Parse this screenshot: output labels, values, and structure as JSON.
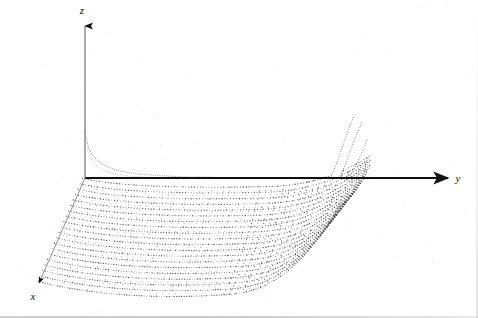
{
  "figure": {
    "kind": "3d-dotted-mesh-surface-plot",
    "background_color": "#ffffff",
    "ink_color": "#1a1a1a",
    "mesh_color": "#3a3a3a",
    "faint_color": "#b8b8b8",
    "axes": {
      "z": {
        "label": "z",
        "direction": "up",
        "origin_px": [
          85,
          178
        ],
        "tip_px": [
          85,
          20
        ],
        "arrow": true
      },
      "y": {
        "label": "y",
        "direction": "right",
        "origin_px": [
          85,
          178
        ],
        "tip_px": [
          452,
          178
        ],
        "arrow": true
      },
      "x": {
        "label": "x",
        "direction": "down-left",
        "origin_px": [
          85,
          178
        ],
        "tip_px": [
          36,
          287
        ],
        "arrow": true
      }
    }
  },
  "chart_data": {
    "type": "line",
    "title": "",
    "xlabel": "x",
    "ylabel": "y",
    "zlabel": "z",
    "projection": "oblique-3d",
    "grid": false,
    "legend": false,
    "xlim": [
      0,
      1
    ],
    "ylim": [
      0,
      1
    ],
    "zlim": [
      -1,
      1
    ],
    "mesh": {
      "profile_curve_count": 20,
      "dotted": true,
      "dot_spacing_px": 3,
      "dot_radius_px": 0.55
    },
    "series": [
      {
        "name": "origin-hyperbola",
        "note": "Steep hyperbolic branch hugging the z-axis at the origin and decaying onto the y-axis.",
        "points": [
          [
            85,
            128
          ],
          [
            86,
            137
          ],
          [
            88,
            145
          ],
          [
            90,
            151
          ],
          [
            93,
            156
          ],
          [
            97,
            160
          ],
          [
            102,
            164
          ],
          [
            108,
            167
          ],
          [
            116,
            170
          ],
          [
            126,
            172
          ],
          [
            138,
            174
          ],
          [
            152,
            175
          ],
          [
            168,
            176
          ],
          [
            186,
            177
          ],
          [
            206,
            177
          ],
          [
            228,
            178
          ]
        ]
      },
      {
        "name": "singular-ridge-1",
        "note": "Innermost steeply rising curve at the far y edge.",
        "points": [
          [
            330,
            178
          ],
          [
            333,
            172
          ],
          [
            336,
            165
          ],
          [
            339,
            157
          ],
          [
            342,
            148
          ],
          [
            345,
            139
          ],
          [
            348,
            131
          ],
          [
            351,
            123
          ],
          [
            354,
            116
          ]
        ]
      },
      {
        "name": "singular-ridge-2",
        "points": [
          [
            339,
            178
          ],
          [
            342,
            172
          ],
          [
            345,
            165
          ],
          [
            348,
            157
          ],
          [
            351,
            149
          ],
          [
            354,
            141
          ],
          [
            357,
            134
          ],
          [
            360,
            127
          ],
          [
            362,
            121
          ]
        ]
      },
      {
        "name": "singular-ridge-3",
        "points": [
          [
            349,
            178
          ],
          [
            352,
            173
          ],
          [
            355,
            167
          ],
          [
            358,
            161
          ],
          [
            361,
            155
          ],
          [
            363,
            150
          ],
          [
            365,
            145
          ],
          [
            367,
            140
          ]
        ]
      }
    ]
  },
  "labels": {
    "z": "z",
    "y": "y",
    "x": "x"
  }
}
